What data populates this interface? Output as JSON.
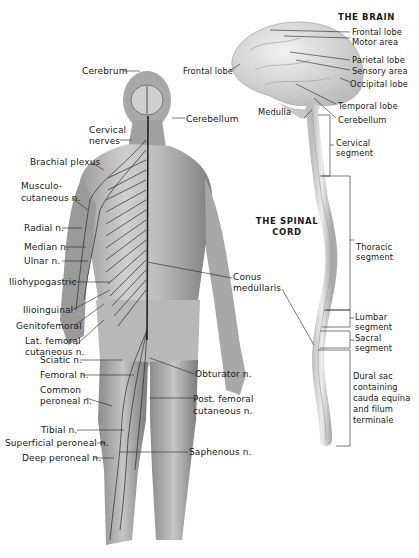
{
  "diagram": {
    "figure_labels": {
      "cerebrum": "Cerebrum",
      "cerebellum": "Cerebellum",
      "cervical_nerves_1": "Cervical",
      "cervical_nerves_2": "nerves",
      "brachial_plexus": "Brachial plexus",
      "musculocutaneous_1": "Musculo-",
      "musculocutaneous_2": "cutaneous n.",
      "radial": "Radial n.",
      "median": "Median n.",
      "ulnar": "Ulnar n.",
      "iliohypogastric": "Iliohypogastric",
      "ilioinguinal": "Ilioinguinal",
      "genitofemoral": "Genitofemoral",
      "lat_femoral_1": "Lat. femoral",
      "lat_femoral_2": "cutaneous n.",
      "sciatic": "Sciatic n.",
      "femoral": "Femoral n.",
      "common_peroneal_1": "Common",
      "common_peroneal_2": "peroneal n.",
      "tibial": "Tibial n.",
      "superficial_peroneal": "Superficial peroneal n.",
      "deep_peroneal": "Deep peroneal n.",
      "conus_1": "Conus",
      "conus_2": "medullaris",
      "obturator": "Obturator n.",
      "post_femoral_1": "Post. femoral",
      "post_femoral_2": "cutaneous n.",
      "saphenous": "Saphenous n."
    },
    "brain": {
      "title": "THE BRAIN",
      "frontal_left": "Frontal lobe",
      "frontal": "Frontal lobe",
      "motor": "Motor area",
      "parietal": "Parietal lobe",
      "sensory": "Sensory area",
      "occipital": "Occipital lobe",
      "temporal": "Temporal lobe",
      "cerebellum": "Cerebellum",
      "medulla": "Medulla"
    },
    "spinal_cord": {
      "title_1": "THE SPINAL",
      "title_2": "CORD",
      "cervical_1": "Cervical",
      "cervical_2": "segment",
      "thoracic_1": "Thoracic",
      "thoracic_2": "segment",
      "lumbar_1": "Lumbar",
      "lumbar_2": "segment",
      "sacral_1": "Sacral",
      "sacral_2": "segment",
      "dural_1": "Dural sac",
      "dural_2": "containing",
      "dural_3": "cauda equina",
      "dural_4": "and filum",
      "dural_5": "terminale"
    },
    "colors": {
      "skin_light": "#d8d8d8",
      "skin_dark": "#8a8a8a",
      "nerve": "#2a2a2a",
      "brain": "#e2e2e2",
      "label_text": "#1a1a1a"
    }
  }
}
